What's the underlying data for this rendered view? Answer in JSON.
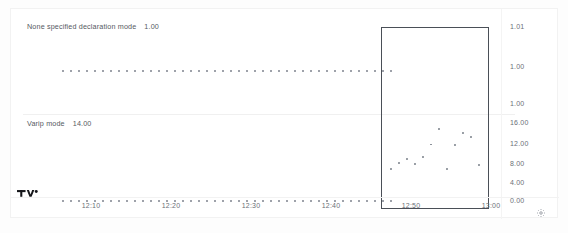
{
  "chart_data": {
    "type": "scatter",
    "title": "",
    "xlabel": "",
    "ylabel": "",
    "grid": false,
    "legend_position": "top-left-inside-pane",
    "panes": [
      {
        "name": "upper-pane",
        "legend_label": "None specified declaration mode",
        "legend_value": "1.00",
        "ylim": [
          1.0,
          1.01
        ],
        "ticks": [
          "1.01",
          "1.00",
          "1.00"
        ],
        "series": [
          {
            "name": "None specified declaration mode",
            "type": "scatter",
            "value": 1.0,
            "x": [
              "12:05",
              "12:06",
              "12:07",
              "12:08",
              "12:09",
              "12:10",
              "12:11",
              "12:12",
              "12:13",
              "12:14",
              "12:15",
              "12:16",
              "12:17",
              "12:18",
              "12:19",
              "12:20",
              "12:21",
              "12:22",
              "12:23",
              "12:24",
              "12:25",
              "12:26",
              "12:27",
              "12:28",
              "12:29",
              "12:30",
              "12:31",
              "12:32",
              "12:33",
              "12:34",
              "12:35",
              "12:36",
              "12:37",
              "12:38",
              "12:39",
              "12:40",
              "12:41",
              "12:42",
              "12:43",
              "12:44",
              "12:45",
              "12:46"
            ],
            "values": [
              1.0,
              1.0,
              1.0,
              1.0,
              1.0,
              1.0,
              1.0,
              1.0,
              1.0,
              1.0,
              1.0,
              1.0,
              1.0,
              1.0,
              1.0,
              1.0,
              1.0,
              1.0,
              1.0,
              1.0,
              1.0,
              1.0,
              1.0,
              1.0,
              1.0,
              1.0,
              1.0,
              1.0,
              1.0,
              1.0,
              1.0,
              1.0,
              1.0,
              1.0,
              1.0,
              1.0,
              1.0,
              1.0,
              1.0,
              1.0,
              1.0,
              1.0
            ]
          }
        ]
      },
      {
        "name": "lower-pane",
        "legend_label": "Varip mode",
        "legend_value": "14.00",
        "ylim": [
          0.0,
          16.0
        ],
        "ticks": [
          "16.00",
          "12.00",
          "8.00",
          "4.00",
          "0.00"
        ],
        "series": [
          {
            "name": "Varip mode baseline",
            "type": "scatter",
            "value": 0.0,
            "x": [
              "12:05",
              "12:06",
              "12:07",
              "12:08",
              "12:09",
              "12:10",
              "12:11",
              "12:12",
              "12:13",
              "12:14",
              "12:15",
              "12:16",
              "12:17",
              "12:18",
              "12:19",
              "12:20",
              "12:21",
              "12:22",
              "12:23",
              "12:24",
              "12:25",
              "12:26",
              "12:27",
              "12:28",
              "12:29",
              "12:30",
              "12:31",
              "12:32",
              "12:33",
              "12:34",
              "12:35",
              "12:36",
              "12:37",
              "12:38",
              "12:39",
              "12:40",
              "12:41",
              "12:42",
              "12:43",
              "12:44",
              "12:45",
              "12:46"
            ],
            "values": [
              0,
              0,
              0,
              0,
              0,
              0,
              0,
              0,
              0,
              0,
              0,
              0,
              0,
              0,
              0,
              0,
              0,
              0,
              0,
              0,
              0,
              0,
              0,
              0,
              0,
              0,
              0,
              0,
              0,
              0,
              0,
              0,
              0,
              0,
              0,
              0,
              0,
              0,
              0,
              0,
              0,
              0
            ]
          },
          {
            "name": "Varip mode",
            "type": "scatter",
            "x": [
              "12:46",
              "12:47",
              "12:48",
              "12:49",
              "12:50",
              "12:51",
              "12:52",
              "12:53",
              "12:54",
              "12:55",
              "12:56",
              "12:57"
            ],
            "values": [
              7.2,
              8.4,
              9.4,
              8.2,
              9.8,
              12.6,
              16.0,
              7.2,
              12.4,
              15.2,
              14.2,
              8.0
            ]
          }
        ]
      }
    ],
    "x_ticks": [
      "12:10",
      "12:20",
      "12:30",
      "12:40",
      "12:50",
      "13:00"
    ],
    "selection": {
      "name": "drag-zoom-selection",
      "x_start": "12:46",
      "x_end": "12:57"
    }
  },
  "axis": {
    "price_labels": [
      "1.01",
      "1.00",
      "1.00",
      "16.00",
      "12.00",
      "8.00",
      "4.00",
      "0.00"
    ],
    "time_labels": [
      "12:10",
      "12:20",
      "12:30",
      "12:40",
      "12:50",
      "13:00"
    ]
  },
  "icons": {
    "settings": "gear-icon",
    "brand": "tradingview-logo"
  },
  "colors": {
    "background": "#ffffff",
    "dot": "#8b9099",
    "selection_border": "#4a4f57",
    "axis_text": "#6a6f78",
    "legend_text": "#555a62"
  }
}
